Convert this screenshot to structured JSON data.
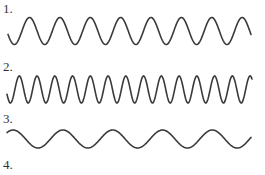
{
  "items": [
    {
      "label": "1.",
      "label_top": 2,
      "wave": {
        "x_start": 8,
        "x_end": 251,
        "center_y": 31,
        "amplitude": 13.5,
        "cycles": 8,
        "phase": 3.4
      }
    },
    {
      "label": "2.",
      "label_top": 60,
      "wave": {
        "x_start": 7,
        "x_end": 252,
        "center_y": 89.5,
        "amplitude": 13.5,
        "cycles": 13.8,
        "phase": 3.5
      }
    },
    {
      "label": "3.",
      "label_top": 112,
      "wave": {
        "x_start": 7,
        "x_end": 251,
        "center_y": 139,
        "amplitude": 9,
        "cycles": 4.9,
        "phase": 0.8
      }
    },
    {
      "label": "4.",
      "label_top": 158,
      "wave": null
    }
  ],
  "colors": {
    "stroke": "#3a3a3a",
    "text": "#333333",
    "background": "#ffffff"
  }
}
